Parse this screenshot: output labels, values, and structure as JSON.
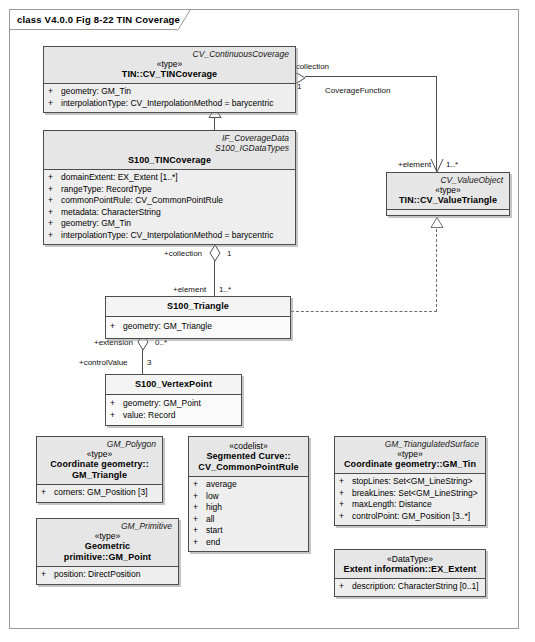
{
  "diagram": {
    "frame_label": "class V4.0.0 Fig 8-22 TIN Coverage",
    "colors": {
      "class_fill": "#e6e6e6",
      "compartment_fill": "#eeeeee",
      "line": "#4d4d4d",
      "frame_border": "#9a9a9a",
      "dashed_line": "#6e6e6e"
    }
  },
  "classes": {
    "cv_tincoverage": {
      "qualifier": "CV_ContinuousCoverage",
      "stereotype": "«type»",
      "name": "TIN::CV_TINCoverage",
      "attributes": [
        {
          "vis": "+",
          "text": "geometry:  GM_Tin"
        },
        {
          "vis": "+",
          "text": "interpolationType:  CV_InterpolationMethod = barycentric"
        }
      ]
    },
    "s100_tincoverage": {
      "qualifier_1": "IF_CoverageData",
      "qualifier_2": "S100_IGDataTypes",
      "stereotype": "",
      "name": "S100_TINCoverage",
      "attributes": [
        {
          "vis": "+",
          "text": "domainExtent:  EX_Extent [1..*]"
        },
        {
          "vis": "+",
          "text": "rangeType:  RecordType"
        },
        {
          "vis": "+",
          "text": "commonPointRule:  CV_CommonPointRule"
        },
        {
          "vis": "+",
          "text": "metadata:  CharacterString"
        },
        {
          "vis": "+",
          "text": "geometry:  GM_Tin"
        },
        {
          "vis": "+",
          "text": "interpolationType:  CV_InterpolationMethod = barycentric"
        }
      ]
    },
    "cv_valuetriangle": {
      "qualifier": "CV_ValueObject",
      "stereotype": "«type»",
      "name": "TIN::CV_ValueTriangle",
      "attributes": []
    },
    "s100_triangle": {
      "qualifier": "",
      "stereotype": "",
      "name": "S100_Triangle",
      "attributes": [
        {
          "vis": "+",
          "text": "geometry:  GM_Triangle"
        }
      ]
    },
    "s100_vertexpoint": {
      "qualifier": "",
      "stereotype": "",
      "name": "S100_VertexPoint",
      "attributes": [
        {
          "vis": "+",
          "text": "geometry:  GM_Point"
        },
        {
          "vis": "+",
          "text": "value:  Record"
        }
      ]
    },
    "gm_triangle": {
      "qualifier": "GM_Polygon",
      "stereotype": "«type»",
      "name_line1": "Coordinate geometry::",
      "name_line2": "GM_Triangle",
      "attributes": [
        {
          "vis": "+",
          "text": "corners:  GM_Position [3]"
        }
      ]
    },
    "gm_point": {
      "qualifier": "GM_Primitive",
      "stereotype": "«type»",
      "name": "Geometric primitive::GM_Point",
      "attributes": [
        {
          "vis": "+",
          "text": "position:  DirectPosition"
        }
      ]
    },
    "cv_commonpointrule": {
      "qualifier": "",
      "stereotype": "«codelist»",
      "name_line1": "Segmented Curve::",
      "name_line2": "CV_CommonPointRule",
      "attributes": [
        {
          "vis": "+",
          "text": "average"
        },
        {
          "vis": "+",
          "text": "low"
        },
        {
          "vis": "+",
          "text": "high"
        },
        {
          "vis": "+",
          "text": "all"
        },
        {
          "vis": "+",
          "text": "start"
        },
        {
          "vis": "+",
          "text": "end"
        }
      ]
    },
    "gm_tin": {
      "qualifier": "GM_TriangulatedSurface",
      "stereotype": "«type»",
      "name": "Coordinate geometry::GM_Tin",
      "attributes": [
        {
          "vis": "+",
          "text": "stopLines:  Set<GM_LineString>"
        },
        {
          "vis": "+",
          "text": "breakLines:  Set<GM_LineString>"
        },
        {
          "vis": "+",
          "text": "maxLength:  Distance"
        },
        {
          "vis": "+",
          "text": "controlPoint:  GM_Position [3..*]"
        }
      ]
    },
    "ex_extent": {
      "qualifier": "",
      "stereotype": "«DataType»",
      "name": "Extent information::EX_Extent",
      "attributes": [
        {
          "vis": "+",
          "text": "description:  CharacterString [0..1]"
        }
      ]
    }
  },
  "connectors": {
    "coverage_function": {
      "name": "CoverageFunction",
      "source_role": "+collection",
      "source_mult": "1",
      "target_role": "+element",
      "target_mult": "1..*"
    },
    "s100_collection": {
      "source_role": "+collection",
      "source_mult": "1",
      "target_role": "+element",
      "target_mult": "1..*"
    },
    "triangle_extension": {
      "source_role": "+extension",
      "source_mult": "0..*",
      "target_role": "+controlValue",
      "target_mult": "3"
    }
  }
}
